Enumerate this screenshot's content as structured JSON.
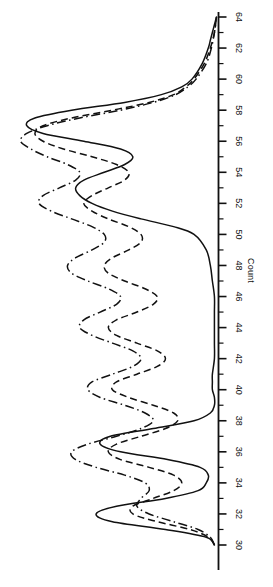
{
  "chart_data": {
    "type": "line",
    "title": "",
    "subtitle": "",
    "xlabel": "",
    "ylabel": "Count",
    "orientation": "horizontal-density",
    "grid": false,
    "legend_position": "none",
    "axis": {
      "name": "Count",
      "min": 30,
      "max": 64,
      "major_step": 2,
      "minor_step": 1,
      "tick_labels": [
        "30",
        "32",
        "34",
        "36",
        "38",
        "40",
        "42",
        "44",
        "46",
        "48",
        "50",
        "52",
        "54",
        "56",
        "58",
        "60",
        "62",
        "64"
      ],
      "tick_values": [
        30,
        32,
        34,
        36,
        38,
        40,
        42,
        44,
        46,
        48,
        50,
        52,
        54,
        56,
        58,
        60,
        62,
        64
      ],
      "minor_tick_values": [
        31,
        33,
        35,
        37,
        39,
        41,
        43,
        45,
        47,
        49,
        51,
        53,
        55,
        57,
        59,
        61,
        63
      ],
      "direction": "increasing-upward"
    },
    "value_axis": {
      "min": 0,
      "max": 1.0,
      "label": "",
      "ticks_shown": false
    },
    "colors": {
      "line": "#111111",
      "axis": "#111111",
      "background": "#ffffff"
    },
    "series": [
      {
        "name": "series-solid",
        "style": "solid",
        "color": "#111111",
        "x": [
          30,
          30.5,
          31,
          31.5,
          32,
          32.5,
          33,
          33.5,
          34,
          34.5,
          35,
          35.5,
          36,
          36.5,
          37,
          37.5,
          38,
          38.5,
          39,
          39.5,
          40,
          40.5,
          41,
          42,
          43,
          44,
          45,
          46,
          47,
          48,
          49,
          50,
          50.5,
          51,
          51.5,
          52,
          52.5,
          53,
          53.5,
          54,
          54.5,
          55,
          55.5,
          56,
          56.5,
          57,
          57.5,
          58,
          58.5,
          59,
          59.5,
          60,
          61,
          62,
          62.5,
          63,
          63.5,
          64
        ],
        "values": [
          0.02,
          0.06,
          0.26,
          0.52,
          0.6,
          0.5,
          0.26,
          0.1,
          0.06,
          0.05,
          0.09,
          0.25,
          0.48,
          0.58,
          0.53,
          0.32,
          0.12,
          0.04,
          0.02,
          0.02,
          0.03,
          0.03,
          0.03,
          0.02,
          0.02,
          0.02,
          0.02,
          0.02,
          0.03,
          0.04,
          0.06,
          0.12,
          0.22,
          0.38,
          0.52,
          0.62,
          0.68,
          0.7,
          0.66,
          0.56,
          0.46,
          0.42,
          0.48,
          0.66,
          0.86,
          0.94,
          0.9,
          0.72,
          0.46,
          0.28,
          0.18,
          0.13,
          0.08,
          0.05,
          0.04,
          0.03,
          0.02,
          0.01
        ]
      },
      {
        "name": "series-dashed",
        "style": "dashed",
        "color": "#111111",
        "x": [
          30,
          30.5,
          31,
          31.5,
          32,
          32.5,
          33,
          33.5,
          34,
          34.5,
          35,
          35.5,
          36,
          36.5,
          37,
          37.5,
          38,
          38.5,
          39,
          39.5,
          40,
          40.5,
          41,
          41.5,
          42,
          42.5,
          43,
          43.5,
          44,
          44.5,
          45,
          45.5,
          46,
          46.5,
          47,
          47.5,
          48,
          48.5,
          49,
          49.5,
          50,
          50.5,
          51,
          51.5,
          52,
          52.5,
          53,
          53.5,
          54,
          54.5,
          55,
          55.5,
          56,
          56.5,
          57,
          57.5,
          58,
          58.5,
          59,
          59.5,
          60,
          61,
          62,
          63,
          64
        ],
        "values": [
          0.02,
          0.05,
          0.14,
          0.3,
          0.42,
          0.42,
          0.32,
          0.22,
          0.18,
          0.22,
          0.34,
          0.48,
          0.54,
          0.5,
          0.38,
          0.26,
          0.2,
          0.22,
          0.32,
          0.44,
          0.52,
          0.5,
          0.4,
          0.3,
          0.26,
          0.3,
          0.4,
          0.5,
          0.54,
          0.5,
          0.4,
          0.32,
          0.3,
          0.36,
          0.46,
          0.54,
          0.56,
          0.52,
          0.44,
          0.38,
          0.38,
          0.44,
          0.54,
          0.62,
          0.66,
          0.62,
          0.54,
          0.46,
          0.44,
          0.5,
          0.62,
          0.76,
          0.86,
          0.9,
          0.86,
          0.72,
          0.52,
          0.34,
          0.22,
          0.16,
          0.12,
          0.07,
          0.04,
          0.02,
          0.01
        ]
      },
      {
        "name": "series-dashdot",
        "style": "dashdot",
        "color": "#111111",
        "x": [
          30,
          30.5,
          31,
          31.5,
          32,
          32.5,
          33,
          33.5,
          34,
          34.5,
          35,
          35.5,
          36,
          36.5,
          37,
          37.5,
          38,
          38.5,
          39,
          39.5,
          40,
          40.5,
          41,
          41.5,
          42,
          42.5,
          43,
          43.5,
          44,
          44.5,
          45,
          45.5,
          46,
          46.5,
          47,
          47.5,
          48,
          48.5,
          49,
          49.5,
          50,
          50.5,
          51,
          51.5,
          52,
          52.5,
          53,
          53.5,
          54,
          54.5,
          55,
          55.5,
          56,
          56.5,
          57,
          57.5,
          58,
          58.5,
          59,
          59.5,
          60,
          61,
          62,
          63,
          64
        ],
        "values": [
          0.02,
          0.04,
          0.1,
          0.22,
          0.34,
          0.4,
          0.38,
          0.34,
          0.36,
          0.46,
          0.6,
          0.7,
          0.72,
          0.64,
          0.5,
          0.38,
          0.32,
          0.36,
          0.46,
          0.58,
          0.64,
          0.62,
          0.52,
          0.42,
          0.38,
          0.42,
          0.52,
          0.62,
          0.68,
          0.66,
          0.58,
          0.5,
          0.48,
          0.54,
          0.64,
          0.72,
          0.74,
          0.7,
          0.62,
          0.56,
          0.56,
          0.62,
          0.72,
          0.82,
          0.88,
          0.86,
          0.78,
          0.7,
          0.68,
          0.74,
          0.84,
          0.92,
          0.97,
          0.94,
          0.84,
          0.68,
          0.48,
          0.32,
          0.21,
          0.15,
          0.11,
          0.06,
          0.035,
          0.02,
          0.01
        ]
      }
    ]
  }
}
